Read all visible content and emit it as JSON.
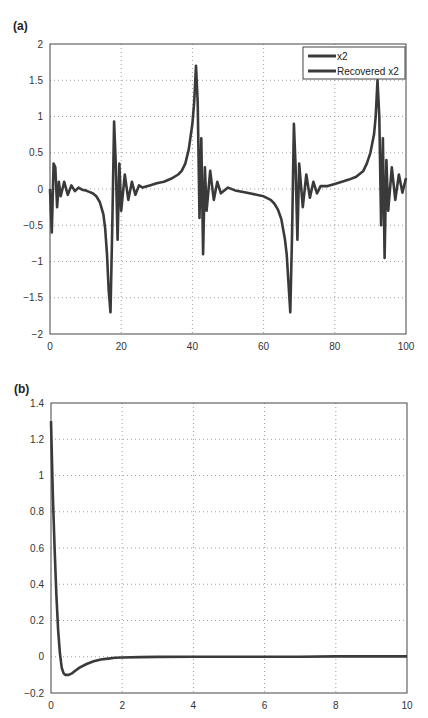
{
  "chart_data": [
    {
      "panel": "(a)",
      "type": "line",
      "title": "",
      "xlabel": "",
      "ylabel": "",
      "xlim": [
        0,
        100
      ],
      "ylim": [
        -2,
        2
      ],
      "xticks": [
        0,
        20,
        40,
        60,
        80,
        100
      ],
      "yticks": [
        -2,
        -1.5,
        -1,
        -0.5,
        0,
        0.5,
        1,
        1.5,
        2
      ],
      "grid": true,
      "legend_position": "upper right",
      "legend": [
        "x2",
        "Recovered x2"
      ],
      "series": [
        {
          "name": "x2",
          "x": [
            0,
            0.5,
            1,
            1.5,
            2,
            2.5,
            3,
            4,
            5,
            6,
            7,
            8,
            9,
            10,
            11,
            12,
            13,
            14,
            15,
            15.5,
            16,
            16.5,
            17,
            17.5,
            18,
            18.5,
            19,
            19.5,
            20,
            21,
            22,
            23,
            24,
            25,
            26,
            28,
            30,
            32,
            34,
            36,
            37,
            38,
            39,
            40,
            40.5,
            41,
            41.5,
            42,
            42.5,
            43,
            43.5,
            44,
            45,
            46,
            47,
            48,
            50,
            52,
            55,
            58,
            60,
            62,
            63,
            64,
            65,
            66,
            66.5,
            67,
            67.5,
            68,
            68.5,
            69,
            69.5,
            70,
            71,
            72,
            73,
            74,
            75,
            76,
            78,
            80,
            82,
            84,
            86,
            88,
            89,
            90,
            91,
            91.5,
            92,
            92.5,
            93,
            93.5,
            94,
            94.5,
            95,
            96,
            97,
            98,
            99,
            100
          ],
          "values": [
            0,
            -0.6,
            0.35,
            0.3,
            -0.25,
            0.1,
            -0.1,
            0.1,
            -0.08,
            0.05,
            -0.03,
            0.02,
            -0.01,
            -0.02,
            -0.04,
            -0.06,
            -0.1,
            -0.18,
            -0.35,
            -0.55,
            -0.9,
            -1.4,
            -1.7,
            -0.5,
            0.93,
            0.3,
            -0.7,
            0.35,
            -0.3,
            0.2,
            -0.15,
            0.1,
            -0.08,
            0.05,
            0.02,
            0.05,
            0.08,
            0.1,
            0.14,
            0.2,
            0.25,
            0.35,
            0.55,
            0.9,
            1.2,
            1.7,
            1.2,
            -0.4,
            0.7,
            -0.9,
            0.3,
            -0.3,
            0.25,
            -0.15,
            0.1,
            -0.06,
            0.02,
            -0.02,
            -0.05,
            -0.08,
            -0.1,
            -0.15,
            -0.2,
            -0.28,
            -0.42,
            -0.7,
            -0.9,
            -1.3,
            -1.7,
            -0.6,
            0.9,
            0.3,
            -0.7,
            0.35,
            -0.25,
            0.2,
            -0.12,
            0.1,
            -0.06,
            0.04,
            0.04,
            0.07,
            0.1,
            0.13,
            0.17,
            0.25,
            0.35,
            0.5,
            0.75,
            1.0,
            1.5,
            1.0,
            -0.5,
            0.7,
            -0.95,
            0.4,
            -0.3,
            0.3,
            -0.15,
            0.2,
            -0.05,
            0.15
          ]
        },
        {
          "name": "Recovered x2",
          "note": "overlaps x2 trajectory",
          "values_same_as": "x2"
        }
      ]
    },
    {
      "panel": "(b)",
      "type": "line",
      "title": "",
      "xlabel": "",
      "ylabel": "",
      "xlim": [
        0,
        10
      ],
      "ylim": [
        -0.2,
        1.4
      ],
      "xticks": [
        0,
        2,
        4,
        6,
        8,
        10
      ],
      "yticks": [
        -0.2,
        0,
        0.2,
        0.4,
        0.6,
        0.8,
        1,
        1.2,
        1.4
      ],
      "grid": true,
      "legend": [],
      "series": [
        {
          "name": "error",
          "x": [
            0,
            0.05,
            0.1,
            0.15,
            0.2,
            0.25,
            0.3,
            0.35,
            0.4,
            0.5,
            0.6,
            0.7,
            0.8,
            1.0,
            1.2,
            1.4,
            1.6,
            1.8,
            2.0,
            2.5,
            3,
            4,
            5,
            6,
            7,
            8,
            9,
            10
          ],
          "values": [
            1.3,
            0.9,
            0.6,
            0.35,
            0.15,
            0.02,
            -0.06,
            -0.09,
            -0.1,
            -0.1,
            -0.09,
            -0.075,
            -0.06,
            -0.04,
            -0.025,
            -0.015,
            -0.01,
            -0.006,
            -0.004,
            -0.002,
            -0.001,
            0,
            0,
            0,
            0,
            0.002,
            0.002,
            0.002
          ]
        }
      ]
    }
  ],
  "labels": {
    "panel_a": "(a)",
    "panel_b": "(b)",
    "legend_x2": "x2",
    "legend_recovered": "Recovered x2"
  },
  "colors": {
    "line": "#3a3a3a",
    "axis": "#444444",
    "grid": "#888888"
  }
}
